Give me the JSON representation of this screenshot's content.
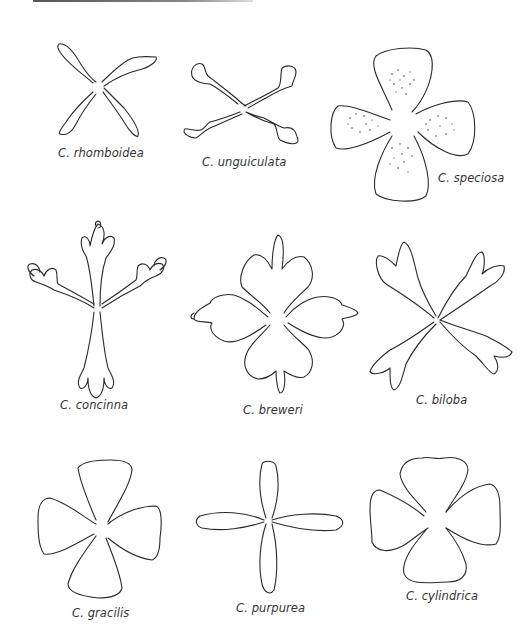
{
  "plate": {
    "description": "Clarkia flower petal forms, nine species",
    "figures": [
      {
        "genus": "C.",
        "species": "rhomboidea",
        "label": "C. rhomboidea"
      },
      {
        "genus": "C.",
        "species": "unguiculata",
        "label": "C. unguiculata"
      },
      {
        "genus": "C.",
        "species": "speciosa",
        "label": "C. speciosa"
      },
      {
        "genus": "C.",
        "species": "concinna",
        "label": "C. concinna"
      },
      {
        "genus": "C.",
        "species": "breweri",
        "label": "C. breweri"
      },
      {
        "genus": "C.",
        "species": "biloba",
        "label": "C. biloba"
      },
      {
        "genus": "C.",
        "species": "gracilis",
        "label": "C. gracilis"
      },
      {
        "genus": "C.",
        "species": "purpurea",
        "label": "C. purpurea"
      },
      {
        "genus": "C.",
        "species": "cylindrica",
        "label": "C. cylindrica"
      }
    ]
  },
  "colors": {
    "line": "#2a2a2a",
    "stipple": "#8a8a8a",
    "background": "#ffffff"
  }
}
